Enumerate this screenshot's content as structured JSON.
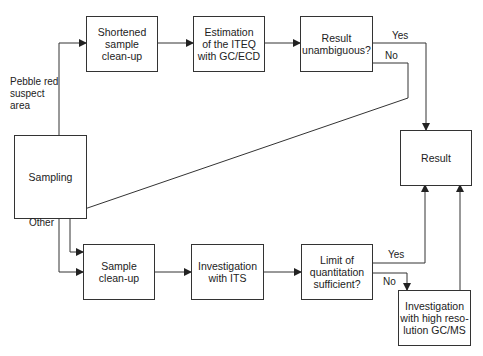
{
  "diagram": {
    "nodes": {
      "shortened": "Shortened\nsample\nclean-up",
      "estimation": "Estimation\nof the ITEQ\nwith GC/ECD",
      "unambiguous": "Result\nunambiguous?",
      "sampling": "Sampling",
      "result": "Result",
      "cleanup": "Sample\nclean-up",
      "its": "Investigation\nwith ITS",
      "limit": "Limit of\nquantitation\nsufficient?",
      "highres": "Investigation\nwith high reso-\nlution GC/MS"
    },
    "labels": {
      "pebble": "Pebble red\nsuspect\narea",
      "other": "Other",
      "yes_top": "Yes",
      "no_top": "No",
      "yes_bottom": "Yes",
      "no_bottom": "No"
    },
    "edges": [
      {
        "from": "sampling",
        "to": "shortened",
        "label": "Pebble red suspect area"
      },
      {
        "from": "sampling",
        "to": "cleanup",
        "label": "Other"
      },
      {
        "from": "shortened",
        "to": "estimation"
      },
      {
        "from": "estimation",
        "to": "unambiguous"
      },
      {
        "from": "unambiguous",
        "to": "result",
        "label": "Yes"
      },
      {
        "from": "unambiguous",
        "to": "cleanup",
        "label": "No"
      },
      {
        "from": "cleanup",
        "to": "its"
      },
      {
        "from": "its",
        "to": "limit"
      },
      {
        "from": "limit",
        "to": "result",
        "label": "Yes"
      },
      {
        "from": "limit",
        "to": "highres",
        "label": "No"
      },
      {
        "from": "highres",
        "to": "result"
      }
    ],
    "colors": {
      "line": "#333333",
      "background": "#ffffff"
    }
  }
}
